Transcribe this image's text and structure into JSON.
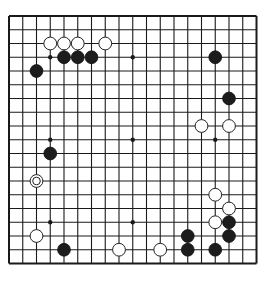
{
  "board": {
    "size": 19,
    "origin_x": 9,
    "origin_y": 16,
    "spacing": 13.75,
    "line_color": "#1a1a1a",
    "background": "#ffffff",
    "star_points": [
      [
        3,
        3
      ],
      [
        9,
        3
      ],
      [
        15,
        3
      ],
      [
        3,
        9
      ],
      [
        9,
        9
      ],
      [
        15,
        9
      ],
      [
        3,
        15
      ],
      [
        9,
        15
      ],
      [
        15,
        15
      ]
    ],
    "stones": [
      {
        "color": "white",
        "col": 3,
        "row": 2
      },
      {
        "color": "white",
        "col": 4,
        "row": 2
      },
      {
        "color": "white",
        "col": 5,
        "row": 2
      },
      {
        "color": "white",
        "col": 7,
        "row": 2
      },
      {
        "color": "black",
        "col": 4,
        "row": 3
      },
      {
        "color": "black",
        "col": 5,
        "row": 3
      },
      {
        "color": "black",
        "col": 6,
        "row": 3
      },
      {
        "color": "black",
        "col": 2,
        "row": 4
      },
      {
        "color": "black",
        "col": 15,
        "row": 3
      },
      {
        "color": "black",
        "col": 16,
        "row": 6
      },
      {
        "color": "white",
        "col": 14,
        "row": 8
      },
      {
        "color": "white",
        "col": 16,
        "row": 8
      },
      {
        "color": "black",
        "col": 3,
        "row": 10
      },
      {
        "color": "white",
        "col": 2,
        "row": 12,
        "marked": true
      },
      {
        "color": "white",
        "col": 2,
        "row": 16
      },
      {
        "color": "black",
        "col": 4,
        "row": 17
      },
      {
        "color": "white",
        "col": 8,
        "row": 17
      },
      {
        "color": "white",
        "col": 11,
        "row": 17
      },
      {
        "color": "black",
        "col": 13,
        "row": 16
      },
      {
        "color": "black",
        "col": 13,
        "row": 17
      },
      {
        "color": "white",
        "col": 15,
        "row": 13
      },
      {
        "color": "white",
        "col": 16,
        "row": 14
      },
      {
        "color": "white",
        "col": 15,
        "row": 15
      },
      {
        "color": "black",
        "col": 16,
        "row": 15
      },
      {
        "color": "black",
        "col": 16,
        "row": 16
      },
      {
        "color": "black",
        "col": 15,
        "row": 17
      }
    ]
  }
}
